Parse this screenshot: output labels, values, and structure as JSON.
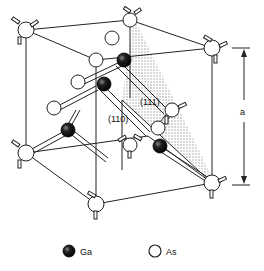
{
  "diagram": {
    "labels": {
      "plane_111": "(111)",
      "plane_110": "(110)",
      "lattice_constant": "a"
    },
    "legend": [
      {
        "symbol": "filled-sphere",
        "label": "Ga",
        "color": "#111111"
      },
      {
        "symbol": "open-sphere",
        "label": "As",
        "color": "#ffffff"
      }
    ],
    "colors": {
      "line": "#222222",
      "ga_fill": "#111111",
      "as_fill": "#ffffff",
      "shade": "#bdbdbd"
    }
  }
}
